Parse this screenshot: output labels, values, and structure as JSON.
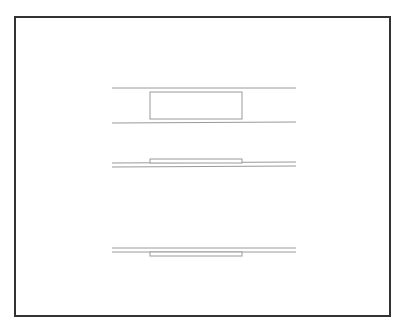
{
  "figure": {
    "width": 403,
    "height": 330,
    "background": "#ffffff",
    "frame": {
      "x": 15,
      "y": 17,
      "width": 375,
      "height": 299,
      "stroke": "#333333",
      "stroke_width": 2
    },
    "line_color": "#9a9a9a",
    "groups": [
      {
        "name": "wide-channel-with-block",
        "lines": [
          {
            "x1": 112,
            "y1": 88,
            "x2": 296,
            "y2": 88
          },
          {
            "x1": 112,
            "y1": 123,
            "x2": 296,
            "y2": 122
          }
        ],
        "rect": {
          "x": 150,
          "y": 92,
          "width": 92,
          "height": 27
        }
      },
      {
        "name": "narrow-channel-block-above",
        "lines": [
          {
            "x1": 112,
            "y1": 163,
            "x2": 296,
            "y2": 162
          },
          {
            "x1": 112,
            "y1": 167,
            "x2": 296,
            "y2": 166
          }
        ],
        "rect": {
          "x": 150,
          "y": 159,
          "width": 92,
          "height": 4
        }
      },
      {
        "name": "narrow-channel-block-below",
        "lines": [
          {
            "x1": 112,
            "y1": 248,
            "x2": 296,
            "y2": 248
          },
          {
            "x1": 112,
            "y1": 252,
            "x2": 296,
            "y2": 252
          }
        ],
        "rect": {
          "x": 150,
          "y": 252,
          "width": 92,
          "height": 4
        }
      }
    ]
  }
}
